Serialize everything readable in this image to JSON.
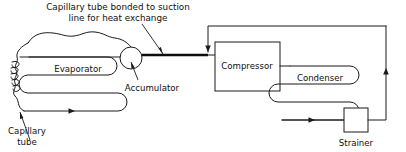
{
  "diagram": {
    "title_line_1": "Capillary tube bonded to suction",
    "title_line_2": "line for heat exchange",
    "components": {
      "evaporator": "Evaporator",
      "accumulator": "Accumulator",
      "compressor": "Compressor",
      "condenser": "Condenser",
      "strainer": "Strainer",
      "capillary_tube_line_1": "Capillary",
      "capillary_tube_line_2": "tube"
    },
    "colors": {
      "stroke": "#1a1a1a",
      "bold_stroke": "#0d0d0d",
      "background": "#ffffff",
      "text": "#101010"
    }
  }
}
